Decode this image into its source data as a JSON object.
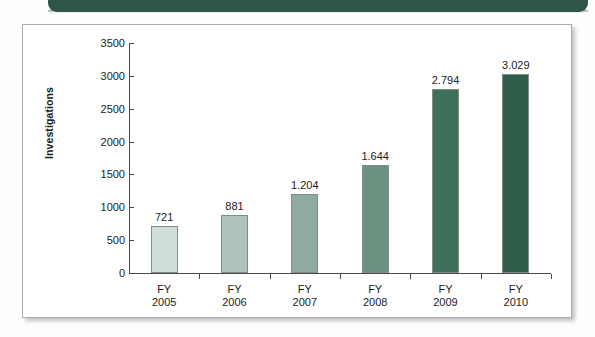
{
  "banner": {
    "color": "#2f5547"
  },
  "panel": {
    "border_color": "#a9adb0",
    "background": "#ffffff"
  },
  "chart_data": {
    "type": "bar",
    "title": "",
    "xlabel": "",
    "ylabel": "Investigations",
    "ylim": [
      0,
      3500
    ],
    "ytick_interval": 500,
    "grid": false,
    "legend": null,
    "categories": [
      "FY 2005",
      "FY 2006",
      "FY 2007",
      "FY 2008",
      "FY 2009",
      "FY 2010"
    ],
    "category_lines": [
      [
        "FY",
        "2005"
      ],
      [
        "FY",
        "2006"
      ],
      [
        "FY",
        "2007"
      ],
      [
        "FY",
        "2008"
      ],
      [
        "FY",
        "2009"
      ],
      [
        "FY",
        "2010"
      ]
    ],
    "values": [
      721,
      881,
      1204,
      1644,
      2794,
      3029
    ],
    "value_labels": [
      "721",
      "881",
      "1.204",
      "1.644",
      "2.794",
      "3.029"
    ],
    "bar_colors": [
      "#cfdfd8",
      "#aec3b9",
      "#8fab9f",
      "#6d9181",
      "#3f7059",
      "#2f5f4a"
    ],
    "ytick_labels": [
      "3500",
      "3000",
      "2500",
      "2000",
      "1500",
      "1000",
      "500",
      "0"
    ],
    "ytick_values": [
      3500,
      3000,
      2500,
      2000,
      1500,
      1000,
      500,
      0
    ]
  }
}
